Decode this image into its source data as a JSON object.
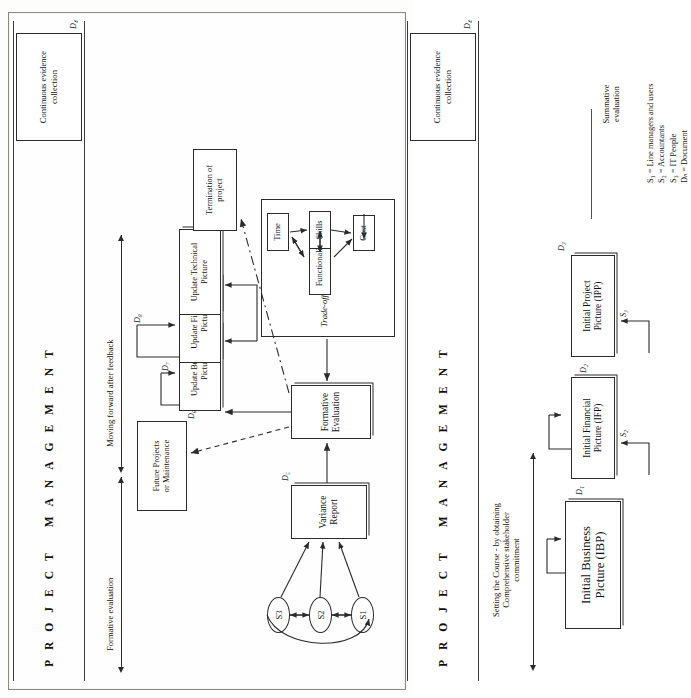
{
  "diagram": {
    "band_label": "PROJECT MANAGEMENT",
    "band_letters_group1": "PROJECT",
    "band_letters_group2": "MANAGEMENT",
    "evidence_box": "Continuous evidence collection",
    "evidence_box_doc": "D₄"
  },
  "phase1": {
    "heading_line1": "Setting  the Course - by obtaining",
    "heading_line2": "Comprehensive stakeholder",
    "heading_line3": "commitment",
    "summative_label_line1": "Summative",
    "summative_label_line2": "evaluation",
    "nodes": [
      {
        "label": "Initial Business Picture (IBP)",
        "doc": "D₁",
        "actor": ""
      },
      {
        "label": "Initial Financial Picture (IFP)",
        "doc": "D₂",
        "actor": "S₂"
      },
      {
        "label": "Initial Project Picture (IPP)",
        "doc": "D₃",
        "actor": "S₃"
      }
    ],
    "ibp_line1": "Initial Business",
    "ibp_line2": "Picture (IBP)",
    "ifp_line1": "Initial Financial",
    "ifp_line2": "Picture (IFP)",
    "ipp_line1": "Initial Project",
    "ipp_line2": "Picture (IPP)"
  },
  "phase2": {
    "formative_label": "Formative evaluation",
    "moving_label": "Moving forward after feedback",
    "stakeholders": [
      "S1",
      "S2",
      "S3"
    ],
    "variance_line1": "Variance",
    "variance_line2": "Report",
    "variance_doc": "D₅",
    "formative_line1": "Formative",
    "formative_line2": "Evaluation",
    "tradeoff_title": "Trade-off box",
    "tradeoff_nodes": [
      "Time",
      "Functionality",
      "Skills",
      "Cost"
    ],
    "future_line1": "Future Projects",
    "future_line2": "or Maintenance",
    "termination_line1": "Termination of",
    "termination_line2": "project",
    "updates": [
      {
        "line1": "Update Business",
        "line2": "Picture",
        "doc": "D₆"
      },
      {
        "line1": "Update Financial",
        "line2": "Picture",
        "doc": "D₇"
      },
      {
        "line1": "Update Technical",
        "line2": "Picture",
        "doc": "D₈"
      }
    ]
  },
  "legend": {
    "items": [
      "S₁ = Line managers and users",
      "S₂ = Accountants",
      "S₃ = IT People",
      "Dₙ = Document"
    ]
  }
}
